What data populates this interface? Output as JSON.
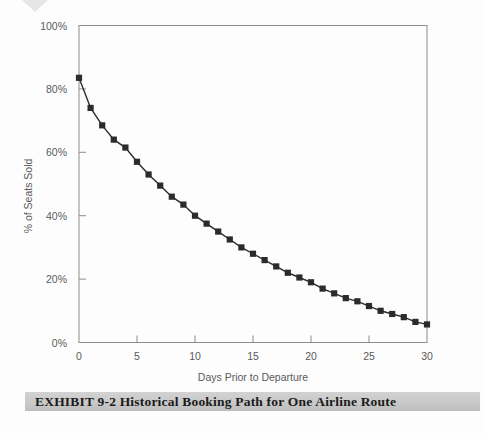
{
  "page": {
    "background_color": "#fdfdfd",
    "scan_mark_color": "#e2e2e2"
  },
  "caption": {
    "label": "EXHIBIT 9-2  Historical Booking Path for One Airline Route",
    "band_color": "#c9c9c9",
    "text_color": "#1b1b1b"
  },
  "chart_data": {
    "type": "line",
    "title": "",
    "subtitle": "",
    "xlabel": "Days Prior to Departure",
    "ylabel": "% of Seats Sold",
    "xlim": [
      0,
      30
    ],
    "ylim": [
      0,
      100
    ],
    "xticks": [
      0,
      5,
      10,
      15,
      20,
      25,
      30
    ],
    "xtick_labels": [
      "0",
      "5",
      "10",
      "15",
      "20",
      "25",
      "30"
    ],
    "yticks": [
      0,
      20,
      40,
      60,
      80,
      100
    ],
    "ytick_labels": [
      "0%",
      "20%",
      "40%",
      "60%",
      "80%",
      "100%"
    ],
    "grid": false,
    "legend": null,
    "legend_position": "none",
    "marker": "square",
    "marker_color": "#2b2b2b",
    "line_color": "#2b2b2b",
    "axis_color": "#8c8c8c",
    "series": [
      {
        "name": "% of Seats Sold",
        "x": [
          0,
          1,
          2,
          3,
          4,
          5,
          6,
          7,
          8,
          9,
          10,
          11,
          12,
          13,
          14,
          15,
          16,
          17,
          18,
          19,
          20,
          21,
          22,
          23,
          24,
          25,
          26,
          27,
          28,
          29,
          30
        ],
        "values": [
          83.5,
          74.0,
          68.5,
          64.0,
          61.5,
          57.0,
          53.0,
          49.5,
          46.0,
          43.5,
          40.0,
          37.5,
          35.0,
          32.5,
          30.0,
          28.0,
          26.0,
          24.0,
          22.0,
          20.5,
          19.0,
          17.0,
          15.5,
          14.0,
          13.0,
          11.5,
          10.0,
          9.0,
          8.0,
          6.5,
          5.7
        ]
      }
    ]
  }
}
